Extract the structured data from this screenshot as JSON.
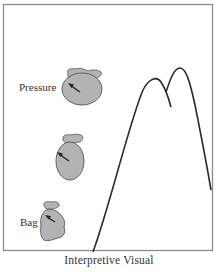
{
  "figure": {
    "caption": "Interpretive Visual",
    "labels": {
      "top_bag": "Pressure",
      "bottom_bag": "Bag"
    },
    "colors": {
      "frame": "#8a8a8a",
      "bag_fill": "#b3b3b3",
      "bag_stroke": "#555555",
      "curve": "#2a2a2a",
      "arrow": "#222222"
    },
    "elements": [
      {
        "type": "bag",
        "name": "large-rounded-bag",
        "position": "top",
        "label": "Pressure"
      },
      {
        "type": "bag",
        "name": "oval-bag",
        "position": "middle"
      },
      {
        "type": "bag",
        "name": "small-crumpled-bag",
        "position": "bottom",
        "label": "Bag"
      },
      {
        "type": "curve",
        "name": "double-peak-curve",
        "description": "two-peaked mountain-like line"
      }
    ]
  }
}
